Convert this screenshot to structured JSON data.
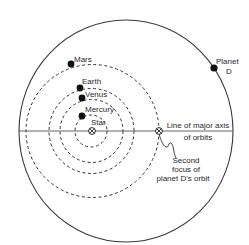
{
  "diagram": {
    "title": "",
    "colors": {
      "background": "#ffffff",
      "line": "#3a3a3a",
      "orbit_dash": "#333333",
      "planet": "#111111",
      "text": "#2a2a2a"
    },
    "star": {
      "label": "Star"
    },
    "planets": [
      {
        "name": "Mercury",
        "label": "Mercury"
      },
      {
        "name": "Venus",
        "label": "Venus"
      },
      {
        "name": "Earth",
        "label": "Earth"
      },
      {
        "name": "Mars",
        "label": "Mars"
      }
    ],
    "planet_d": {
      "label_line1": "Planet",
      "label_line2": "D"
    },
    "axis": {
      "label_line1": "Line of major axis",
      "label_line2": "of orbits"
    },
    "second_focus": {
      "label_line1": "Second",
      "label_line2": "focus of",
      "label_line3": "planet D's orbit"
    }
  }
}
